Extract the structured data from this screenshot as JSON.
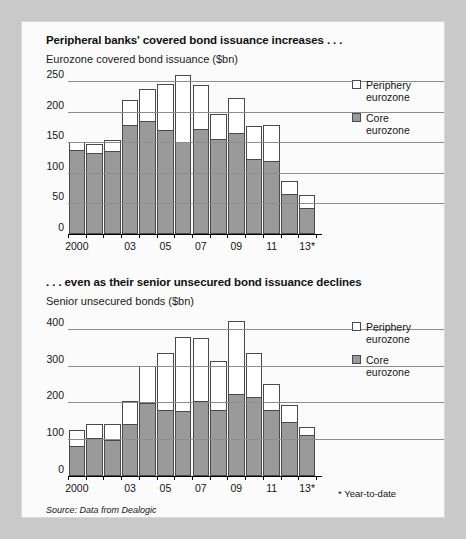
{
  "figure": {
    "source_note": "Source: Data from Dealogic",
    "footnote": "* Year-to-date",
    "colors": {
      "core_fill": "#9a9a9a",
      "periphery_fill": "#ffffff",
      "outline": "#4a4a4a",
      "gridline": "#8d8d8d",
      "panel_bg": "#fbfbfb",
      "page_bg": "#c9c9c9"
    }
  },
  "legend": {
    "periphery": {
      "line1": "Periphery",
      "line2": "eurozone"
    },
    "core": {
      "line1": "Core",
      "line2": "eurozone"
    }
  },
  "chart_data": [
    {
      "type": "bar",
      "id": "covered-bond-issuance",
      "title": "Peripheral banks' covered bond issuance increases . . .",
      "subtitle": "Eurozone covered bond issuance ($bn)",
      "xlabel": "",
      "ylabel": "Eurozone covered bond issuance ($bn)",
      "stacked": true,
      "grid": true,
      "legend_position": "right",
      "ylim": [
        0,
        265
      ],
      "yticks": [
        0,
        50,
        100,
        150,
        200,
        250
      ],
      "ytick_labels": [
        "0",
        "50",
        "100",
        "150",
        "200",
        "250"
      ],
      "categories": [
        "2000",
        "01",
        "02",
        "03",
        "04",
        "05",
        "06",
        "07",
        "08",
        "09",
        "10",
        "11",
        "12",
        "13*"
      ],
      "xtick_labels": [
        "2000",
        "03",
        "05",
        "07",
        "09",
        "11",
        "13*"
      ],
      "xtick_indices": [
        0,
        3,
        5,
        7,
        9,
        11,
        13
      ],
      "series": [
        {
          "name": "Core eurozone",
          "values": [
            137,
            132,
            135,
            178,
            185,
            170,
            150,
            172,
            155,
            165,
            122,
            120,
            65,
            42
          ]
        },
        {
          "name": "Periphery eurozone",
          "values": [
            13,
            15,
            18,
            42,
            52,
            75,
            110,
            72,
            42,
            58,
            55,
            58,
            22,
            22
          ]
        }
      ],
      "totals": [
        150,
        147,
        153,
        220,
        237,
        245,
        260,
        244,
        197,
        223,
        177,
        178,
        87,
        64
      ]
    },
    {
      "type": "bar",
      "id": "senior-unsecured-bonds",
      "title": ". . . even as their senior unsecured bond issuance declines",
      "subtitle": "Senior unsecured bonds ($bn)",
      "xlabel": "",
      "ylabel": "Senior unsecured bonds ($bn)",
      "stacked": true,
      "grid": true,
      "legend_position": "right",
      "ylim": [
        0,
        440
      ],
      "yticks": [
        0,
        100,
        200,
        300,
        400
      ],
      "ytick_labels": [
        "0",
        "100",
        "200",
        "300",
        "400"
      ],
      "categories": [
        "2000",
        "01",
        "02",
        "03",
        "04",
        "05",
        "06",
        "07",
        "08",
        "09",
        "10",
        "11",
        "12",
        "13*"
      ],
      "xtick_labels": [
        "2000",
        "03",
        "05",
        "07",
        "09",
        "11",
        "13*"
      ],
      "xtick_indices": [
        0,
        3,
        5,
        7,
        9,
        11,
        13
      ],
      "series": [
        {
          "name": "Core eurozone",
          "values": [
            82,
            103,
            98,
            140,
            198,
            178,
            177,
            203,
            178,
            222,
            215,
            178,
            148,
            112
          ]
        },
        {
          "name": "Periphery eurozone",
          "values": [
            42,
            37,
            42,
            65,
            102,
            155,
            200,
            172,
            135,
            200,
            120,
            72,
            45,
            20
          ]
        }
      ],
      "totals": [
        124,
        140,
        140,
        205,
        300,
        333,
        377,
        375,
        313,
        422,
        335,
        250,
        193,
        132
      ]
    }
  ]
}
